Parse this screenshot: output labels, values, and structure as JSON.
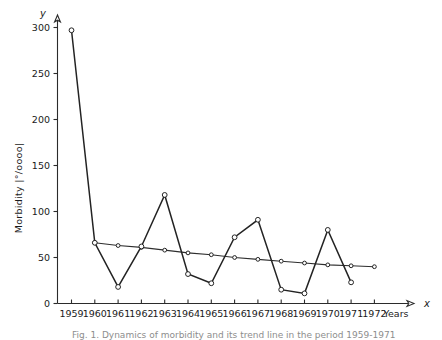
{
  "figure": {
    "y_axis_symbol": "y",
    "x_axis_symbol": "x",
    "y_axis_title": "Morbidity |°/oooo|",
    "x_axis_unit_label": "Years",
    "caption": "Fig. 1. Dynamics of morbidity and its trend line in the period 1959-1971"
  },
  "chart_data": {
    "type": "line",
    "title": "",
    "xlabel": "Years",
    "ylabel": "Morbidity |°/oooo|",
    "xlim": [
      1958.4,
      1972.6
    ],
    "ylim": [
      0,
      305
    ],
    "yticks": [
      0,
      50,
      100,
      150,
      200,
      250,
      300
    ],
    "xticks": [
      1959,
      1960,
      1961,
      1962,
      1963,
      1964,
      1965,
      1966,
      1967,
      1968,
      1969,
      1970,
      1971,
      1972
    ],
    "tick_labels_x": [
      "1959",
      "1960",
      "1961",
      "1962",
      "1963",
      "1964",
      "1965",
      "1966",
      "1967",
      "1968",
      "1969",
      "1970",
      "1971",
      "1972"
    ],
    "tick_labels_y": [
      "0",
      "50",
      "100",
      "150",
      "200",
      "250",
      "300"
    ],
    "grid": false,
    "legend": false,
    "markers": "open-circle",
    "series": [
      {
        "name": "Morbidity",
        "x": [
          1959,
          1960,
          1961,
          1962,
          1963,
          1964,
          1965,
          1966,
          1967,
          1968,
          1969,
          1970,
          1971
        ],
        "values": [
          297,
          66,
          18,
          62,
          118,
          32,
          22,
          72,
          91,
          15,
          11,
          80,
          23
        ]
      },
      {
        "name": "Trend",
        "x": [
          1960,
          1961,
          1962,
          1963,
          1964,
          1965,
          1966,
          1967,
          1968,
          1969,
          1970,
          1971,
          1972
        ],
        "values": [
          66,
          63,
          61,
          58,
          55,
          53,
          50,
          48,
          46,
          44,
          42,
          41,
          40
        ]
      }
    ]
  }
}
